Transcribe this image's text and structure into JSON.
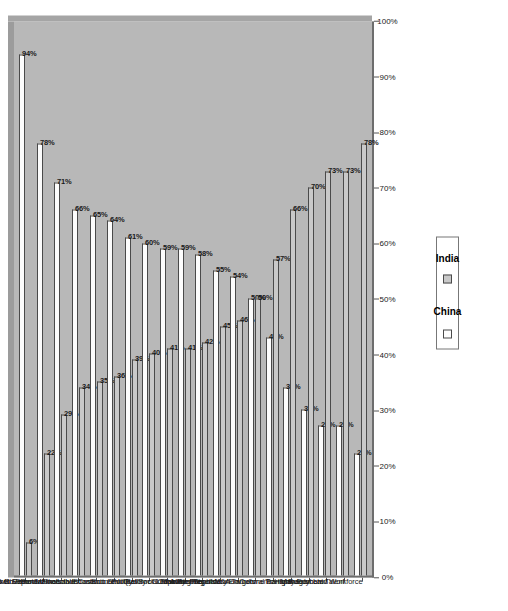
{
  "chart_data": {
    "type": "bar",
    "title": "",
    "subtitle": "",
    "xlabel": "",
    "ylabel": "",
    "xlim": [
      0,
      100
    ],
    "grid": false,
    "orientation": "horizontal",
    "legend_position": "bottom",
    "axis_ticks": [
      "0%",
      "10%",
      "20%",
      "30%",
      "40%",
      "50%",
      "60%",
      "70%",
      "80%",
      "90%",
      "100%"
    ],
    "axis_tick_values": [
      0,
      10,
      20,
      30,
      40,
      50,
      60,
      70,
      80,
      90,
      100
    ],
    "categories": [
      "Market Size",
      "Market Growth Potential",
      "Access to Export Markets",
      "Government Incentives",
      "Production/Labor Costs",
      "Infrastructure",
      "Financial/Economic Stability",
      "Economic Reform",
      "Quality of Life",
      "Political/Social Stability",
      "Tax Regime",
      "Competitor Presence",
      "Consumer Sophistication",
      "Availability of M&A Targets",
      "Regulatory Environments",
      "Cultural Barriers",
      "Transparency",
      "Rule of Law",
      "Management Talent",
      "Highly Educated Workforce"
    ],
    "series": [
      {
        "name": "China",
        "color": "#fdfdfd",
        "values": [
          94,
          78,
          71,
          66,
          65,
          64,
          61,
          60,
          59,
          59,
          58,
          55,
          54,
          50,
          43,
          34,
          30,
          27,
          27,
          22
        ],
        "labels": [
          "94%",
          "78%",
          "71%",
          "66%",
          "65%",
          "64%",
          "61%",
          "60%",
          "59%",
          "59%",
          "58%",
          "55%",
          "54%",
          "50%",
          "43%",
          "34%",
          "30%",
          "27%",
          "27%",
          "22%"
        ]
      },
      {
        "name": "India",
        "color": "#c9c9c9",
        "values": [
          6,
          22,
          29,
          34,
          35,
          36,
          39,
          40,
          41,
          41,
          42,
          45,
          46,
          50,
          57,
          66,
          70,
          73,
          73,
          78
        ],
        "labels": [
          "6%",
          "22%",
          "29%",
          "34%",
          "35%",
          "36%",
          "39%",
          "40%",
          "41%",
          "41%",
          "42%",
          "45%",
          "46%",
          "50%",
          "57%",
          "66%",
          "70%",
          "73%",
          "73%",
          "78%"
        ]
      }
    ]
  },
  "legend": {
    "items": [
      {
        "label": "China",
        "swatch": "china"
      },
      {
        "label": "India",
        "swatch": "india"
      }
    ]
  }
}
